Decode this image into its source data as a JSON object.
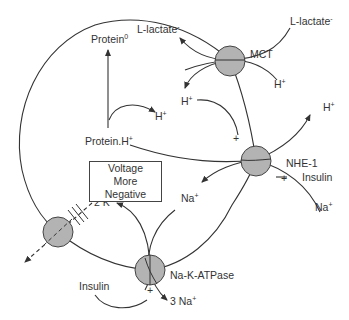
{
  "diagram": {
    "transporters": {
      "mct": {
        "label": "MCT"
      },
      "nhe": {
        "label": "NHE-1"
      },
      "nak": {
        "label": "Na-K-ATPase"
      }
    },
    "labels": {
      "lactate_in": {
        "text": "L-lactate",
        "sup": "-"
      },
      "lactate_out": {
        "text": "L-lactate",
        "sup": "-"
      },
      "protein0": {
        "text": "Protein",
        "sup": "0"
      },
      "protein_h": {
        "text": "Protein.H",
        "sup": "+"
      },
      "h_mct_in": {
        "text": "H",
        "sup": "+"
      },
      "h_mct_out": {
        "text": "H",
        "sup": "+"
      },
      "h_protein": {
        "text": "H",
        "sup": "+"
      },
      "h_nhe_out": {
        "text": "H",
        "sup": "+"
      },
      "na_nhe_in": {
        "text": "Na",
        "sup": "+"
      },
      "na_nhe_out": {
        "text": "Na",
        "sup": "+"
      },
      "k_in": {
        "text": "2 K",
        "sup": "+"
      },
      "na_out": {
        "text": "3 Na",
        "sup": "+"
      },
      "insulin_nhe": {
        "text": "Insulin"
      },
      "insulin_nak": {
        "text": "Insulin"
      },
      "plus_nhe_top": {
        "text": "+"
      },
      "plus_nhe_insulin": {
        "text": "+"
      },
      "plus_nak": {
        "text": "+"
      }
    },
    "voltage_box": {
      "line1": "Voltage",
      "line2": "More Negative"
    },
    "colors": {
      "line": "#333333",
      "transporter_fill": "#b3b3b3",
      "text": "#333333"
    }
  }
}
